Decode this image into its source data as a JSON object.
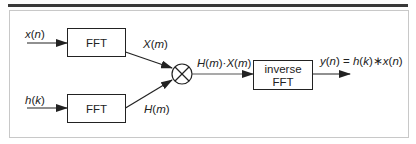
{
  "diagram": {
    "inputs": {
      "x": {
        "name": "x",
        "arg": "n",
        "label": "x(n)"
      },
      "h": {
        "name": "h",
        "arg": "k",
        "label": "h(k)"
      }
    },
    "blocks": {
      "fft_top": {
        "label": "FFT"
      },
      "fft_bottom": {
        "label": "FFT"
      },
      "multiplier": {
        "symbol": "multiply-circle"
      },
      "ifft": {
        "line1": "inverse",
        "line2": "FFT"
      }
    },
    "signals": {
      "X_m": {
        "name": "X",
        "arg": "m",
        "label": "X(m)"
      },
      "H_m": {
        "name": "H",
        "arg": "m",
        "label": "H(m)"
      },
      "product": {
        "a_name": "H",
        "a_arg": "m",
        "op": "·",
        "b_name": "X",
        "b_arg": "m",
        "label": "H(m)·X(m)"
      },
      "output": {
        "y_name": "y",
        "y_arg": "n",
        "eq": " = ",
        "h_name": "h",
        "h_arg": "k",
        "op": "∗",
        "x_name": "x",
        "x_arg": "n",
        "label": "y(n) = h(k)∗x(n)"
      }
    },
    "colors": {
      "stroke": "#222222",
      "frame": "#c8c8c8",
      "topbar": "#3a3a3a",
      "line_gray": "#555555"
    }
  }
}
